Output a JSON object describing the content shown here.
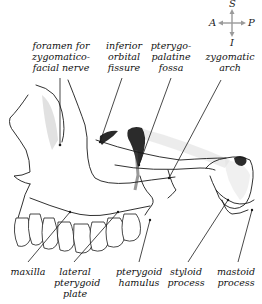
{
  "figure": {
    "colors": {
      "line": "#1a1a1a",
      "shade": "#555555",
      "compass": "#9a9a9a",
      "text": "#111111"
    }
  },
  "compass": {
    "superior": "S",
    "inferior": "I",
    "anterior": "A",
    "posterior": "P"
  },
  "labels": {
    "top": [
      {
        "id": "foramen-zygomaticofacial",
        "lines": [
          "foramen for",
          "zygomatico-",
          "facial nerve"
        ]
      },
      {
        "id": "inferior-orbital-fissure",
        "lines": [
          "inferior",
          "orbital",
          "fissure"
        ]
      },
      {
        "id": "pterygopalatine-fossa",
        "lines": [
          "pterygo-",
          "palatine",
          "fossa"
        ]
      },
      {
        "id": "zygomatic-arch",
        "lines": [
          "zygomatic",
          "arch"
        ]
      }
    ],
    "bottom": [
      {
        "id": "maxilla",
        "lines": [
          "maxilla"
        ]
      },
      {
        "id": "lateral-pterygoid-plate",
        "lines": [
          "lateral",
          "pterygoid",
          "plate"
        ]
      },
      {
        "id": "pterygoid-hamulus",
        "lines": [
          "pterygoid",
          "hamulus"
        ]
      },
      {
        "id": "styloid-process",
        "lines": [
          "styloid",
          "process"
        ]
      },
      {
        "id": "mastoid-process",
        "lines": [
          "mastoid",
          "process"
        ]
      }
    ]
  }
}
